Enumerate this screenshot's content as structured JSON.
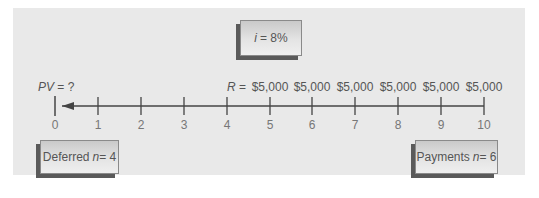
{
  "diagram": {
    "rate_box": {
      "var": "i",
      "text": "= 8%"
    },
    "pv_label": {
      "var": "PV",
      "text": " = ?"
    },
    "payment_prefix": {
      "var": "R",
      "text": " = "
    },
    "payments": [
      "$5,000",
      "$5,000",
      "$5,000",
      "$5,000",
      "$5,000",
      "$5,000"
    ],
    "ticks": [
      "0",
      "1",
      "2",
      "3",
      "4",
      "5",
      "6",
      "7",
      "8",
      "9",
      "10"
    ],
    "deferred_box": {
      "label": "Deferred ",
      "var": "n",
      "text": " = 4"
    },
    "payments_box": {
      "label": "Payments ",
      "var": "n",
      "text": " = 6"
    },
    "colors": {
      "panel": "#e9e9e9",
      "line": "#444444",
      "box_shadow": "#5a5a5a"
    }
  }
}
